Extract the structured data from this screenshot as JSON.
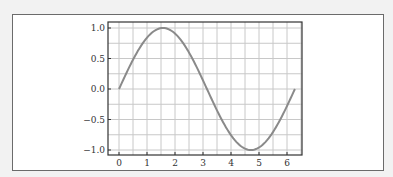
{
  "chart_data": {
    "type": "line",
    "title": "",
    "xlabel": "",
    "ylabel": "",
    "function": "sin(x)",
    "xlim": [
      -0.4,
      6.6
    ],
    "ylim": [
      -1.1,
      1.1
    ],
    "x_ticks": [
      "0",
      "1",
      "2",
      "3",
      "4",
      "5",
      "6"
    ],
    "y_ticks": [
      "1.0",
      "0.5",
      "0.0",
      "-0.5",
      "-1.0"
    ],
    "grid": true,
    "legend": null,
    "series": [
      {
        "name": "sin(x)",
        "color": "#8a8a8a",
        "x": [
          0,
          0.5,
          1.0,
          1.5708,
          2.0,
          2.5,
          3.0,
          3.1416,
          3.5,
          4.0,
          4.7124,
          5.0,
          5.5,
          6.0,
          6.2832
        ],
        "y": [
          0,
          0.479,
          0.841,
          1.0,
          0.909,
          0.598,
          0.141,
          0.0,
          -0.351,
          -0.757,
          -1.0,
          -0.959,
          -0.706,
          -0.279,
          0.0
        ]
      }
    ]
  },
  "colors": {
    "background": "#f2f2f2",
    "panel": "#ffffff",
    "axis": "#333333",
    "grid": "#c8c8c8",
    "curve": "#8a8a8a"
  }
}
